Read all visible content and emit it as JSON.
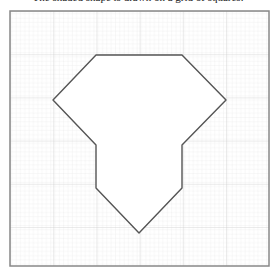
{
  "caption": "The shaded shape is drawn on a grid of squares.",
  "diagram": {
    "type": "polygon-on-grid",
    "frame": {
      "x": 10,
      "y": 11,
      "width": 259,
      "height": 255,
      "stroke": "#888888"
    },
    "grid": {
      "minor_spacing": 4.32,
      "major_spacing": 43.2,
      "minor_color": "#e6e6e6",
      "major_color": "#cfcfcf"
    },
    "shape": {
      "fill": "#ffffff",
      "stroke": "#555555",
      "points": [
        [
          96,
          55
        ],
        [
          182,
          55
        ],
        [
          226,
          100
        ],
        [
          182,
          145
        ],
        [
          182,
          188
        ],
        [
          139,
          233
        ],
        [
          96,
          188
        ],
        [
          96,
          145
        ],
        [
          53,
          100
        ]
      ]
    }
  }
}
